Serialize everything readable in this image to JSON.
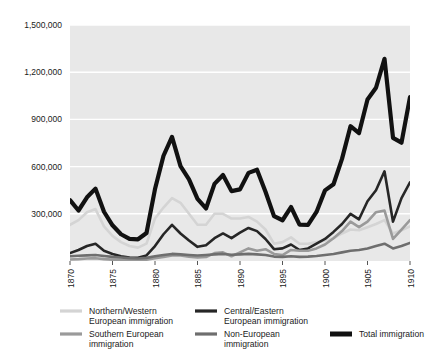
{
  "chart_data": {
    "type": "line",
    "title": "",
    "subtitle": "",
    "xlabel": "",
    "ylabel": "",
    "xlim": [
      1870,
      1910
    ],
    "ylim": [
      0,
      1500000
    ],
    "grid": true,
    "grid_axis": "y",
    "legend_position": "bottom",
    "plot_background": "#e8e8e8",
    "ytick_labels": [
      "1,500,000",
      "1,200,000",
      "900,000",
      "600,000",
      "300,000"
    ],
    "ytick_values": [
      1500000,
      1200000,
      900000,
      600000,
      300000
    ],
    "xtick_labels": [
      "1870",
      "1875",
      "1880",
      "1885",
      "1890",
      "1895",
      "1900",
      "1905",
      "1910"
    ],
    "xtick_values": [
      1870,
      1875,
      1880,
      1885,
      1890,
      1895,
      1900,
      1905,
      1910
    ],
    "x": [
      1870,
      1871,
      1872,
      1873,
      1874,
      1875,
      1876,
      1877,
      1878,
      1879,
      1880,
      1881,
      1882,
      1883,
      1884,
      1885,
      1886,
      1887,
      1888,
      1889,
      1890,
      1891,
      1892,
      1893,
      1894,
      1895,
      1896,
      1897,
      1898,
      1899,
      1900,
      1901,
      1902,
      1903,
      1904,
      1905,
      1906,
      1907,
      1908,
      1909,
      1910
    ],
    "series": [
      {
        "name": "Northern/Western European immigration",
        "color": "#d4d4d4",
        "width": 2.6,
        "values": [
          230000,
          260000,
          310000,
          330000,
          220000,
          160000,
          120000,
          95000,
          85000,
          110000,
          270000,
          340000,
          400000,
          370000,
          300000,
          230000,
          230000,
          300000,
          300000,
          270000,
          270000,
          280000,
          250000,
          200000,
          110000,
          120000,
          150000,
          110000,
          110000,
          120000,
          130000,
          145000,
          175000,
          200000,
          195000,
          215000,
          235000,
          260000,
          175000,
          195000,
          220000
        ]
      },
      {
        "name": "Central/Eastern European immigration",
        "color": "#262626",
        "width": 2.6,
        "values": [
          50000,
          70000,
          95000,
          110000,
          65000,
          45000,
          30000,
          22000,
          20000,
          35000,
          95000,
          170000,
          230000,
          175000,
          130000,
          90000,
          100000,
          145000,
          175000,
          145000,
          180000,
          210000,
          190000,
          140000,
          75000,
          80000,
          105000,
          70000,
          80000,
          110000,
          140000,
          185000,
          235000,
          300000,
          265000,
          380000,
          450000,
          570000,
          250000,
          400000,
          500000
        ]
      },
      {
        "name": "Southern European immigration",
        "color": "#9a9a9a",
        "width": 2.6,
        "values": [
          10000,
          12000,
          16000,
          18000,
          12000,
          9000,
          7000,
          5000,
          5000,
          8000,
          18000,
          25000,
          35000,
          35000,
          27000,
          22000,
          25000,
          50000,
          55000,
          30000,
          55000,
          80000,
          65000,
          75000,
          45000,
          38000,
          70000,
          65000,
          65000,
          80000,
          105000,
          145000,
          190000,
          250000,
          215000,
          250000,
          310000,
          320000,
          140000,
          200000,
          260000
        ]
      },
      {
        "name": "Non-European immigration",
        "color": "#6e6e6e",
        "width": 2.6,
        "values": [
          30000,
          33000,
          36000,
          38000,
          32000,
          26000,
          22000,
          18000,
          16000,
          20000,
          30000,
          38000,
          45000,
          42000,
          38000,
          35000,
          38000,
          42000,
          45000,
          40000,
          42000,
          45000,
          42000,
          38000,
          28000,
          26000,
          30000,
          26000,
          28000,
          32000,
          38000,
          45000,
          55000,
          65000,
          70000,
          80000,
          95000,
          110000,
          80000,
          95000,
          115000
        ]
      },
      {
        "name": "Total immigration",
        "color": "#111111",
        "width": 4.2,
        "values": [
          387000,
          321000,
          405000,
          460000,
          313000,
          227000,
          170000,
          141000,
          138000,
          178000,
          457000,
          669000,
          789000,
          603000,
          519000,
          395000,
          334000,
          490000,
          547000,
          444000,
          455000,
          560000,
          580000,
          440000,
          285000,
          259000,
          343000,
          231000,
          229000,
          312000,
          449000,
          488000,
          649000,
          857000,
          813000,
          1026000,
          1101000,
          1285000,
          783000,
          752000,
          1042000
        ]
      }
    ]
  },
  "legend": {
    "entries": [
      {
        "label_line1": "Northern/Western",
        "label_line2": "European immigration",
        "color": "#d4d4d4",
        "thick": false
      },
      {
        "label_line1": "Central/Eastern",
        "label_line2": "European immigration",
        "color": "#262626",
        "thick": false
      },
      {
        "label_line1": "Southern European",
        "label_line2": "immigration",
        "color": "#9a9a9a",
        "thick": false
      },
      {
        "label_line1": "Non-European",
        "label_line2": "immigration",
        "color": "#6e6e6e",
        "thick": false
      },
      {
        "label_line1": "Total immigration",
        "label_line2": "",
        "color": "#111111",
        "thick": true
      }
    ]
  }
}
